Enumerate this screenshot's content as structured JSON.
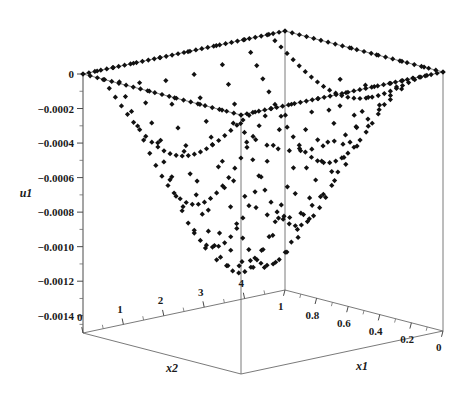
{
  "chart_data": {
    "type": "scatter",
    "projection": "3d",
    "title": "",
    "subtitle": "",
    "background_color": "#ffffff",
    "marker": {
      "shape": "diamond",
      "color": "#111111",
      "size_px": 4
    },
    "axes": {
      "x1": {
        "label": "x1",
        "tick_labels": [
          "1",
          "0.8",
          "0.6",
          "0.4",
          "0.2",
          "0"
        ],
        "tick_values": [
          1,
          0.8,
          0.6,
          0.4,
          0.2,
          0
        ],
        "range": [
          1,
          0
        ],
        "direction": "decreasing-left-to-right",
        "minor_ticks_per_interval": 1
      },
      "x2": {
        "label": "x2",
        "tick_labels": [
          "0",
          "1",
          "2",
          "3",
          "4"
        ],
        "tick_values": [
          0,
          1,
          2,
          3,
          4
        ],
        "range": [
          0,
          5
        ],
        "direction": "increasing-left-to-right",
        "minor_ticks_per_interval": 1
      },
      "u1": {
        "label": "u1",
        "tick_labels": [
          "0",
          "-0.0002",
          "-0.0004",
          "-0.0006",
          "-0.0008",
          "-0.0010",
          "-0.0012",
          "-0.0014"
        ],
        "tick_values": [
          0,
          -0.0002,
          -0.0004,
          -0.0006,
          -0.0008,
          -0.001,
          -0.0012,
          -0.0014
        ],
        "range": [
          0,
          -0.0015
        ],
        "direction": "decreasing-downward",
        "minor_ticks_per_interval": 1
      }
    },
    "grid": false,
    "legend": null,
    "series": [
      {
        "name": "u1(x1,x2)",
        "points_x1": [
          1.0,
          0.9,
          0.8,
          0.7,
          0.6,
          0.5,
          0.4,
          0.3,
          0.2,
          0.1,
          0.0
        ],
        "points_x2": [
          0.0,
          0.5,
          1.0,
          1.5,
          2.0,
          2.5,
          3.0,
          3.5,
          4.0,
          4.5,
          5.0
        ],
        "u1_min": -0.00152,
        "u1_max": 0.0
      }
    ]
  },
  "axis_titles": {
    "x1": "x1",
    "x2": "x2",
    "u1": "u1"
  },
  "u1_ticks": [
    {
      "label": "0",
      "value": 0
    },
    {
      "label": "-0.0002",
      "value": -0.0002
    },
    {
      "label": "-0.0004",
      "value": -0.0004
    },
    {
      "label": "-0.0006",
      "value": -0.0006
    },
    {
      "label": "-0.0008",
      "value": -0.0008
    },
    {
      "label": "-0.0010",
      "value": -0.001
    },
    {
      "label": "-0.0012",
      "value": -0.0012
    },
    {
      "label": "-0.0014",
      "value": -0.0014
    }
  ],
  "x2_ticks": [
    {
      "label": "0",
      "value": 0
    },
    {
      "label": "1",
      "value": 1
    },
    {
      "label": "2",
      "value": 2
    },
    {
      "label": "3",
      "value": 3
    },
    {
      "label": "4",
      "value": 4
    }
  ],
  "x1_ticks": [
    {
      "label": "1",
      "value": 1
    },
    {
      "label": "0.8",
      "value": 0.8
    },
    {
      "label": "0.6",
      "value": 0.6
    },
    {
      "label": "0.4",
      "value": 0.4
    },
    {
      "label": "0.2",
      "value": 0.2
    },
    {
      "label": "0",
      "value": 0
    }
  ]
}
